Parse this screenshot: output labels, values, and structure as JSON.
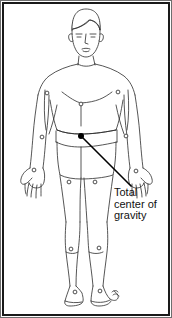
{
  "figure": {
    "kind": "anatomical-line-drawing",
    "view": "anterior",
    "background_color": "#ffffff",
    "line_color": "#2b2b2b",
    "frame_color": "#1a1a1a",
    "marker_color": "#3a3a3a",
    "cog_dot_color": "#000000",
    "leader_line_color": "#000000"
  },
  "annotation": {
    "lines": [
      "Total",
      "center of",
      "gravity"
    ],
    "line1": "Total",
    "line2": "center of",
    "line3": "gravity",
    "text_color": "#111111",
    "anchor_point": {
      "x": 81,
      "y": 136
    },
    "leader_end": {
      "x": 131,
      "y": 186
    }
  },
  "markers": [
    {
      "name": "shoulder-left",
      "x": 47,
      "y": 93
    },
    {
      "name": "shoulder-right",
      "x": 118,
      "y": 92
    },
    {
      "name": "sternum",
      "x": 81,
      "y": 104
    },
    {
      "name": "elbow-left",
      "x": 42,
      "y": 137
    },
    {
      "name": "elbow-right",
      "x": 126,
      "y": 136
    },
    {
      "name": "wrist-left",
      "x": 34,
      "y": 170
    },
    {
      "name": "wrist-right",
      "x": 136,
      "y": 171
    },
    {
      "name": "hip-left",
      "x": 69,
      "y": 182
    },
    {
      "name": "hip-right",
      "x": 95,
      "y": 182
    },
    {
      "name": "knee-left",
      "x": 71,
      "y": 249
    },
    {
      "name": "knee-right",
      "x": 99,
      "y": 248
    },
    {
      "name": "ankle-left",
      "x": 75,
      "y": 292
    },
    {
      "name": "ankle-right",
      "x": 100,
      "y": 291
    }
  ],
  "center_of_gravity": {
    "name": "total-center-of-gravity",
    "x": 81,
    "y": 136,
    "radius": 3
  }
}
